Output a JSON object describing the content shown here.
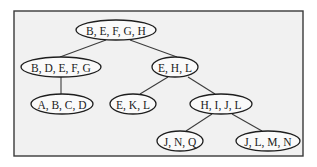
{
  "diagram": {
    "type": "tree",
    "colors": {
      "page_background": "#ffffff",
      "frame_background": "#f1f1f1",
      "frame_border": "#3a3a3a",
      "node_fill": "#fafafa",
      "node_stroke": "#1e1e1e",
      "edge": "#3c3c3c",
      "text": "#1a1a1a"
    },
    "frame": {
      "x": 14,
      "y": 11,
      "width": 289,
      "height": 145
    },
    "nodes": [
      {
        "id": "n0",
        "label": "B, E, F, G, H",
        "cx": 116,
        "cy": 30,
        "rx": 40,
        "ry": 10
      },
      {
        "id": "n1",
        "label": "B, D, E, F, G",
        "cx": 61,
        "cy": 67,
        "rx": 40,
        "ry": 10
      },
      {
        "id": "n2",
        "label": "E, H, L",
        "cx": 175,
        "cy": 67,
        "rx": 23,
        "ry": 10
      },
      {
        "id": "n3",
        "label": "A, B, C, D",
        "cx": 62,
        "cy": 104,
        "rx": 31,
        "ry": 10
      },
      {
        "id": "n4",
        "label": "E, K, L",
        "cx": 133,
        "cy": 104,
        "rx": 23,
        "ry": 10
      },
      {
        "id": "n5",
        "label": "H, I, J, L",
        "cx": 221,
        "cy": 104,
        "rx": 31,
        "ry": 10
      },
      {
        "id": "n6",
        "label": "J, N, Q",
        "cx": 180,
        "cy": 141,
        "rx": 23,
        "ry": 10
      },
      {
        "id": "n7",
        "label": "J, L, M, N",
        "cx": 268,
        "cy": 141,
        "rx": 32,
        "ry": 10
      }
    ],
    "edges": [
      {
        "from": "n0",
        "to": "n1",
        "x1": 106,
        "y1": 40,
        "x2": 60,
        "y2": 57
      },
      {
        "from": "n0",
        "to": "n2",
        "x1": 130,
        "y1": 40,
        "x2": 177,
        "y2": 57
      },
      {
        "from": "n1",
        "to": "n3",
        "x1": 61,
        "y1": 77,
        "x2": 61,
        "y2": 94
      },
      {
        "from": "n2",
        "to": "n4",
        "x1": 168,
        "y1": 77,
        "x2": 140,
        "y2": 94
      },
      {
        "from": "n2",
        "to": "n5",
        "x1": 188,
        "y1": 77,
        "x2": 215,
        "y2": 94
      },
      {
        "from": "n5",
        "to": "n6",
        "x1": 212,
        "y1": 114,
        "x2": 186,
        "y2": 131
      },
      {
        "from": "n5",
        "to": "n7",
        "x1": 232,
        "y1": 114,
        "x2": 262,
        "y2": 131
      }
    ]
  }
}
